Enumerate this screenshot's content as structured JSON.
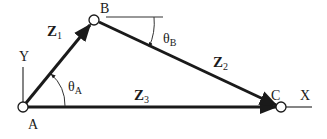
{
  "diagram": {
    "type": "four-bar-loop vector triangle",
    "colors": {
      "line": "#1a1a1a",
      "background": "#ffffff"
    },
    "points": {
      "A": {
        "label": "A",
        "x": 23,
        "y": 107
      },
      "B": {
        "label": "B",
        "x": 94,
        "y": 20
      },
      "C": {
        "label": "C",
        "x": 281,
        "y": 107
      }
    },
    "axes": {
      "x_label": "X",
      "y_label": "Y"
    },
    "vectors": [
      {
        "id": "Z1",
        "symbol": "Z",
        "subscript": "1",
        "from": "A",
        "to": "B"
      },
      {
        "id": "Z2",
        "symbol": "Z",
        "subscript": "2",
        "from": "B",
        "to": "C"
      },
      {
        "id": "Z3",
        "symbol": "Z",
        "subscript": "3",
        "from": "A",
        "to": "C"
      }
    ],
    "angles": [
      {
        "id": "thetaA",
        "symbol": "θ",
        "subscript": "A",
        "at": "A"
      },
      {
        "id": "thetaB",
        "symbol": "θ",
        "subscript": "B",
        "at": "B"
      }
    ]
  }
}
